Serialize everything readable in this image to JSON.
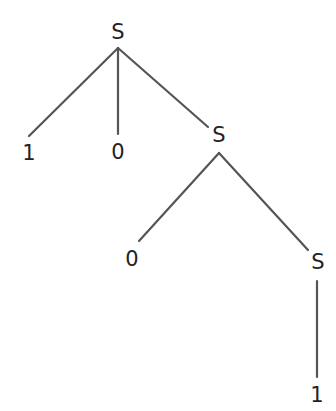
{
  "figure": {
    "kind": "parse-tree",
    "background_color": "#ffffff",
    "edge_color": "#555555",
    "text_color": "#232323",
    "edge_width": 2.2,
    "width": 336,
    "height": 411
  },
  "nodes": [
    {
      "id": "s-root",
      "label": "S",
      "type": "nonterminal",
      "x": 118,
      "y": 32,
      "anchor_x": 118,
      "anchor_y": 48
    },
    {
      "id": "t-1-left",
      "label": "1",
      "type": "terminal",
      "x": 29,
      "y": 153,
      "anchor_x": 29,
      "anchor_y": 136
    },
    {
      "id": "t-0-middle",
      "label": "0",
      "type": "terminal",
      "x": 118,
      "y": 152,
      "anchor_x": 118,
      "anchor_y": 134
    },
    {
      "id": "s-level2",
      "label": "S",
      "type": "nonterminal",
      "x": 219,
      "y": 135,
      "anchor_x": 219,
      "anchor_y": 153
    },
    {
      "id": "t-0-level3",
      "label": "0",
      "type": "terminal",
      "x": 132,
      "y": 259,
      "anchor_x": 138,
      "anchor_y": 241
    },
    {
      "id": "s-level3",
      "label": "S",
      "type": "nonterminal",
      "x": 318,
      "y": 262,
      "anchor_x": 318,
      "anchor_y": 281
    },
    {
      "id": "t-1-bottom",
      "label": "1",
      "type": "terminal",
      "x": 317,
      "y": 395,
      "anchor_x": 317,
      "anchor_y": 377
    }
  ],
  "edges": [
    {
      "id": "edge-root-to-1",
      "from": "s-root",
      "to": "t-1-left",
      "x1": 118,
      "y1": 48,
      "x2": 29,
      "y2": 136
    },
    {
      "id": "edge-root-to-0",
      "from": "s-root",
      "to": "t-0-middle",
      "x1": 118,
      "y1": 48,
      "x2": 118,
      "y2": 134
    },
    {
      "id": "edge-root-to-s2",
      "from": "s-root",
      "to": "s-level2",
      "x1": 118,
      "y1": 48,
      "x2": 208,
      "y2": 127
    },
    {
      "id": "edge-s2-to-0",
      "from": "s-level2",
      "to": "t-0-level3",
      "x1": 219,
      "y1": 153,
      "x2": 139,
      "y2": 241
    },
    {
      "id": "edge-s2-to-s3",
      "from": "s-level2",
      "to": "s-level3",
      "x1": 219,
      "y1": 153,
      "x2": 308,
      "y2": 250
    },
    {
      "id": "edge-s3-to-1",
      "from": "s-level3",
      "to": "t-1-bottom",
      "x1": 317,
      "y1": 281,
      "x2": 317,
      "y2": 377
    }
  ],
  "derivation": {
    "root_symbol": "S",
    "productions": [
      "S -> 1 0 S",
      "S -> 0 S",
      "S -> 1"
    ],
    "yield": "1 0 0 1"
  }
}
